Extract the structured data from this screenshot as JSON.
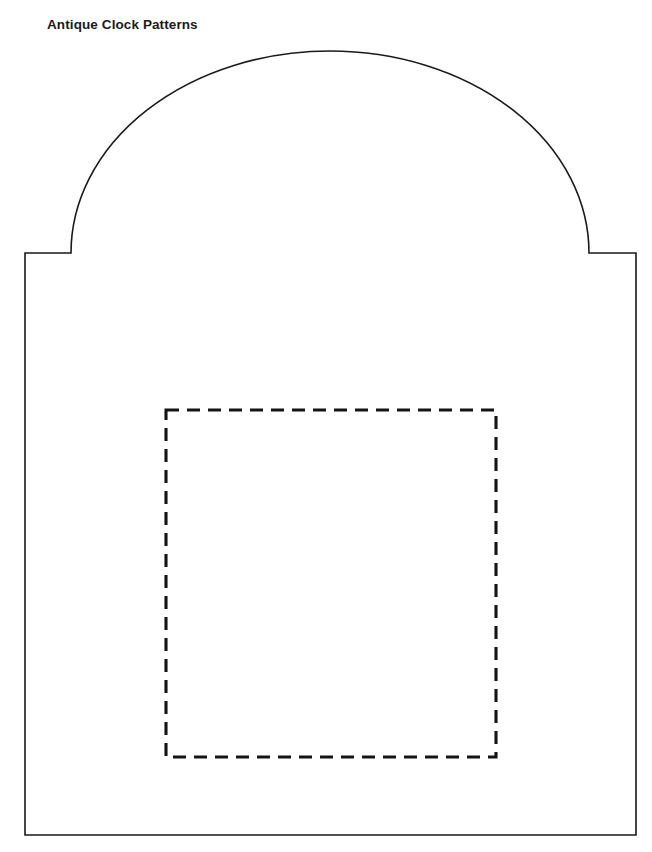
{
  "document": {
    "title": "Antique Clock Patterns",
    "background_color": "#ffffff",
    "width": 652,
    "height": 852
  },
  "header": {
    "title": "Antique Clock Patterns",
    "title_color": "#1a1a1a",
    "title_x": 47,
    "title_y": 17,
    "font_size": 13.5,
    "font_weight": "bold"
  },
  "drawing": {
    "name": "antique-clock-case-template",
    "description": "Line drawing template of an arch-topped antique clock case body with an inner dashed placement rectangle.",
    "stroke_color": "#1a1a1a",
    "stroke_width": 1.6,
    "fill_color": "#ffffff",
    "body": {
      "left_edge_x": 25,
      "right_edge_x": 636,
      "bottom_edge_y": 835,
      "shoulder_y": 253,
      "left_ledge_end_x": 71,
      "right_ledge_start_x": 589
    },
    "arch": {
      "shape": "ellipse-arc",
      "center_x": 330,
      "center_y": 253,
      "radius_x": 259,
      "radius_y": 202,
      "apex_y": 51,
      "start_x": 71,
      "end_x": 589
    },
    "outline_path": "M 25 835 L 25 253 L 71 253 A 259 202 0 0 1 589 253 L 636 253 L 636 835 Z",
    "dashed_rectangle": {
      "name": "inner-placement-rectangle",
      "x": 166,
      "y": 410,
      "width": 330,
      "height": 347,
      "stroke_color": "#141414",
      "stroke_width": 3.1,
      "dash_length": 13,
      "dash_gap": 8,
      "dash_array": "13 8"
    }
  }
}
